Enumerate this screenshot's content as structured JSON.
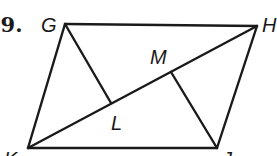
{
  "problem": {
    "number": "29."
  },
  "diagram": {
    "stroke_color": "#1a1a1a",
    "background": "#ffffff",
    "points": {
      "G": {
        "label": "G",
        "x": 65,
        "y": 24
      },
      "H": {
        "label": "H",
        "x": 257,
        "y": 26
      },
      "J": {
        "label": "J",
        "x": 217,
        "y": 148
      },
      "K": {
        "label": "K",
        "x": 28,
        "y": 148
      },
      "L": {
        "label": "L",
        "x": 111,
        "y": 103
      },
      "M": {
        "label": "M",
        "x": 171,
        "y": 72
      }
    },
    "segments": [
      {
        "from": "G",
        "to": "H"
      },
      {
        "from": "H",
        "to": "J"
      },
      {
        "from": "J",
        "to": "K"
      },
      {
        "from": "K",
        "to": "G"
      },
      {
        "from": "K",
        "to": "H"
      },
      {
        "from": "G",
        "to": "L"
      },
      {
        "from": "J",
        "to": "M"
      }
    ],
    "label_positions": {
      "G": {
        "x": 41,
        "y": 32
      },
      "H": {
        "x": 262,
        "y": 32
      },
      "J": {
        "x": 222,
        "y": 166
      },
      "K": {
        "x": 4,
        "y": 166
      },
      "L": {
        "x": 111,
        "y": 130
      },
      "M": {
        "x": 150,
        "y": 64
      }
    }
  }
}
